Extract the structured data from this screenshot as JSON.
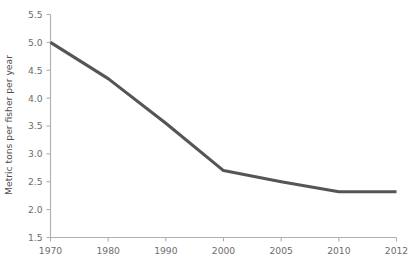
{
  "chart_data": {
    "type": "line",
    "title": "",
    "subtitle": "",
    "xlabel": "",
    "ylabel": "Metric tons per fisher per year",
    "categories": [
      "1970",
      "1980",
      "1990",
      "2000",
      "2005",
      "2010",
      "2012"
    ],
    "x_tick_labels": [
      "1970",
      "1980",
      "1990",
      "2000",
      "2005",
      "2010",
      "2012"
    ],
    "y_tick_labels": [
      "1.5",
      "2.0",
      "2.5",
      "3.0",
      "3.5",
      "4.0",
      "4.5",
      "5.0",
      "5.5"
    ],
    "y_tick_values": [
      1.5,
      2.0,
      2.5,
      3.0,
      3.5,
      4.0,
      4.5,
      5.0,
      5.5
    ],
    "ylim": [
      1.5,
      5.5
    ],
    "grid": false,
    "legend": false,
    "legend_position": "none",
    "series": [
      {
        "name": "Metric tons per fisher per year",
        "color": "#555555",
        "values": [
          5.0,
          4.35,
          3.55,
          2.7,
          2.5,
          2.32,
          2.32
        ]
      }
    ],
    "axis_color": "#b0b0b0",
    "label_color": "#6d6d6d"
  }
}
